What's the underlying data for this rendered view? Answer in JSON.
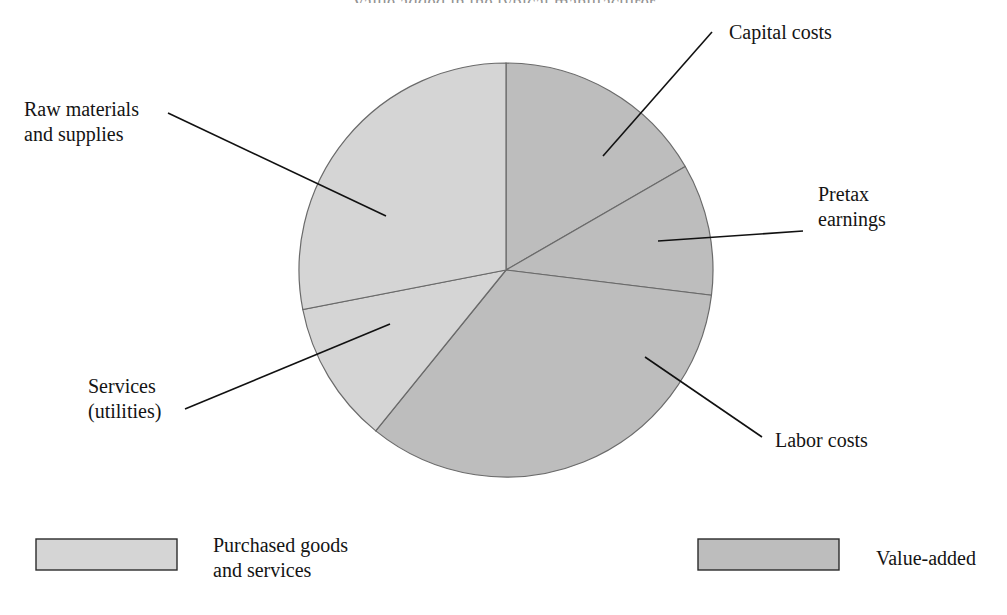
{
  "figure": {
    "title_partial": "Value added in the typical manufacturer"
  },
  "chart_data": {
    "type": "pie",
    "title": "",
    "legend_position": "bottom",
    "grid": false,
    "start_angle_deg": 0,
    "direction": "clockwise",
    "categories": [
      "Capital costs",
      "Pretax earnings",
      "Labor costs",
      "Services (utilities)",
      "Raw materials and supplies"
    ],
    "values": [
      17,
      10,
      34,
      11,
      28
    ],
    "units": "percent",
    "slices": [
      {
        "label": "Capital costs",
        "value": 17,
        "start_deg": 0,
        "end_deg": 60,
        "group": "Value-added",
        "color": "#bdbdbd"
      },
      {
        "label": "Pretax earnings",
        "value": 10,
        "start_deg": 60,
        "end_deg": 97,
        "group": "Value-added",
        "color": "#bdbdbd"
      },
      {
        "label": "Labor costs",
        "value": 34,
        "start_deg": 97,
        "end_deg": 219,
        "group": "Value-added",
        "color": "#bdbdbd"
      },
      {
        "label": "Services (utilities)",
        "value": 11,
        "start_deg": 219,
        "end_deg": 259,
        "group": "Purchased goods and services",
        "color": "#d5d5d5"
      },
      {
        "label": "Raw materials and supplies",
        "value": 28,
        "start_deg": 259,
        "end_deg": 360,
        "group": "Purchased goods and services",
        "color": "#d5d5d5"
      }
    ],
    "legend": [
      {
        "label": "Purchased goods\nand services",
        "color": "#d5d5d5"
      },
      {
        "label": "Value-added",
        "color": "#bdbdbd"
      }
    ]
  },
  "callouts": {
    "capital_costs": "Capital costs",
    "pretax_earnings": "Pretax\nearnings",
    "labor_costs": "Labor costs",
    "services": "Services\n(utilities)",
    "raw_materials": "Raw materials\nand supplies"
  },
  "legend": {
    "purchased_label": "Purchased goods\nand services",
    "value_added_label": "Value-added"
  },
  "colors": {
    "purchased_fill": "#d5d5d5",
    "value_added_fill": "#bdbdbd",
    "slice_outline": "#6a6a6a",
    "leader_line": "#111111",
    "swatch_border": "#2b2b2b"
  }
}
